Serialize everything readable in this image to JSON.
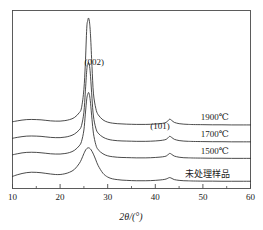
{
  "chart_data": {
    "type": "line",
    "title": "",
    "xlabel": "2θ/(°)",
    "ylabel": "",
    "xlim": [
      10,
      60
    ],
    "ylim": [
      0,
      100
    ],
    "grid": false,
    "legend_position": "inline-right",
    "xticks": [
      10,
      20,
      30,
      40,
      50,
      60
    ],
    "xtick_labels": [
      "10",
      "20",
      "30",
      "40",
      "50",
      "60"
    ],
    "xminorticks": [
      15,
      25,
      35,
      45,
      55
    ],
    "yticks": [],
    "ytick_labels": [],
    "annotations": [
      {
        "text": "(002)",
        "x": 27.2,
        "y": 97,
        "note": "graphite 002 reflection"
      },
      {
        "text": "(101)",
        "x": 41.0,
        "y": 47,
        "note": "graphite 101 reflection"
      }
    ],
    "series": [
      {
        "name": "1900℃",
        "label": "1900℃",
        "label_x": 52.5,
        "baseline": 50,
        "peak_002_position": 26.0,
        "peak_002_height": 84,
        "peak_002_fwhm": 1.6,
        "peak_101_position": 43.0,
        "peak_101_height": 4.5,
        "x": [
          10,
          11,
          12,
          13,
          14,
          15,
          16,
          17,
          18,
          19,
          20,
          21,
          22,
          23,
          24,
          24.5,
          25,
          25.3,
          25.6,
          25.8,
          26,
          26.2,
          26.4,
          26.7,
          27,
          27.5,
          28,
          29,
          30,
          31,
          32,
          33,
          34,
          35,
          36,
          37,
          38,
          39,
          40,
          41,
          42,
          42.5,
          43,
          43.5,
          44,
          45,
          46,
          47,
          48,
          50,
          52,
          54,
          56,
          58,
          60
        ],
        "y": [
          52.5,
          53.2,
          53.8,
          54.2,
          54.3,
          54.2,
          54.0,
          53.6,
          53.2,
          53.0,
          53.0,
          53.4,
          54.2,
          55.8,
          59.5,
          63.5,
          78.0,
          98.0,
          126.0,
          132.0,
          134.0,
          130.0,
          120.0,
          96.0,
          75.0,
          63.0,
          58.0,
          54.0,
          52.2,
          51.4,
          51.0,
          50.8,
          50.6,
          50.5,
          50.4,
          50.4,
          50.4,
          50.5,
          50.7,
          51.0,
          51.6,
          52.6,
          54.5,
          53.4,
          52.0,
          51.0,
          50.6,
          50.4,
          50.3,
          50.2,
          50.1,
          50.1,
          50.0,
          50.0,
          50.0
        ]
      },
      {
        "name": "1700℃",
        "label": "1700℃",
        "label_x": 52.5,
        "baseline": 37,
        "peak_002_position": 26.0,
        "peak_002_height": 62,
        "peak_002_fwhm": 1.9,
        "peak_101_position": 43.0,
        "peak_101_height": 4.0,
        "x": [
          10,
          11,
          12,
          13,
          14,
          15,
          16,
          17,
          18,
          19,
          20,
          21,
          22,
          23,
          24,
          24.5,
          25,
          25.3,
          25.6,
          25.8,
          26,
          26.2,
          26.4,
          26.7,
          27,
          27.5,
          28,
          29,
          30,
          31,
          32,
          33,
          34,
          35,
          36,
          37,
          38,
          39,
          40,
          41,
          42,
          42.5,
          43,
          43.5,
          44,
          45,
          46,
          47,
          48,
          50,
          52,
          54,
          56,
          58,
          60
        ],
        "y": [
          39.5,
          40.2,
          40.8,
          41.2,
          41.3,
          41.2,
          41.0,
          40.6,
          40.2,
          40.0,
          40.0,
          40.4,
          41.2,
          42.8,
          46.0,
          49.5,
          60.0,
          76.0,
          93.0,
          97.5,
          99.0,
          96.0,
          88.0,
          71.0,
          57.0,
          47.5,
          43.5,
          40.4,
          38.8,
          38.0,
          37.6,
          37.4,
          37.3,
          37.2,
          37.1,
          37.1,
          37.1,
          37.2,
          37.4,
          37.7,
          38.3,
          39.2,
          41.0,
          40.0,
          38.7,
          37.7,
          37.3,
          37.1,
          37.0,
          36.9,
          36.8,
          36.8,
          36.7,
          36.7,
          36.7
        ]
      },
      {
        "name": "1500℃",
        "label": "1500℃",
        "label_x": 52.5,
        "baseline": 24,
        "peak_002_position": 26.0,
        "peak_002_height": 46,
        "peak_002_fwhm": 2.3,
        "peak_101_position": 43.0,
        "peak_101_height": 3.5,
        "x": [
          10,
          11,
          12,
          13,
          14,
          15,
          16,
          17,
          18,
          19,
          20,
          21,
          22,
          23,
          24,
          24.5,
          25,
          25.3,
          25.6,
          25.8,
          26,
          26.2,
          26.4,
          26.7,
          27,
          27.5,
          28,
          29,
          30,
          31,
          32,
          33,
          34,
          35,
          36,
          37,
          38,
          39,
          40,
          41,
          42,
          42.5,
          43,
          43.5,
          44,
          45,
          46,
          47,
          48,
          50,
          52,
          54,
          56,
          58,
          60
        ],
        "y": [
          26.5,
          27.3,
          28.0,
          28.4,
          28.5,
          28.4,
          28.1,
          27.7,
          27.3,
          27.1,
          27.1,
          27.5,
          28.3,
          30.0,
          33.5,
          37.0,
          46.0,
          58.5,
          70.5,
          74.0,
          75.5,
          73.0,
          67.0,
          54.5,
          43.5,
          34.5,
          30.5,
          27.3,
          25.7,
          25.0,
          24.6,
          24.4,
          24.3,
          24.2,
          24.1,
          24.1,
          24.1,
          24.2,
          24.4,
          24.7,
          25.2,
          26.0,
          27.6,
          26.7,
          25.5,
          24.6,
          24.2,
          24.1,
          24.0,
          23.9,
          23.8,
          23.8,
          23.7,
          23.7,
          23.7
        ]
      },
      {
        "name": "未处理样品",
        "label": "未处理样品",
        "label_x": 51.0,
        "baseline": 6,
        "peak_002_position": 26.0,
        "peak_002_height": 26,
        "peak_002_fwhm": 4.2,
        "peak_101_position": 43.0,
        "peak_101_height": 2.5,
        "x": [
          10,
          11,
          12,
          13,
          14,
          15,
          16,
          17,
          18,
          19,
          20,
          21,
          22,
          23,
          24,
          24.5,
          25,
          25.5,
          26,
          26.5,
          27,
          27.5,
          28,
          29,
          30,
          31,
          32,
          33,
          34,
          35,
          36,
          37,
          38,
          39,
          40,
          41,
          42,
          42.5,
          43,
          43.5,
          44,
          45,
          46,
          47,
          48,
          50,
          52,
          54,
          56,
          58,
          60
        ],
        "y": [
          9.5,
          10.8,
          11.8,
          12.5,
          12.8,
          12.7,
          12.4,
          11.9,
          11.4,
          11.0,
          11.0,
          11.6,
          12.8,
          15.0,
          19.5,
          23.0,
          27.5,
          31.0,
          32.0,
          30.5,
          27.0,
          22.5,
          18.0,
          12.0,
          9.0,
          7.6,
          7.0,
          6.6,
          6.4,
          6.2,
          6.1,
          6.1,
          6.1,
          6.2,
          6.4,
          6.7,
          7.2,
          7.8,
          8.6,
          7.9,
          7.0,
          6.4,
          6.1,
          6.0,
          5.9,
          5.8,
          5.8,
          5.7,
          5.7,
          5.7,
          5.7
        ]
      }
    ]
  },
  "style": {
    "line_color": "#2b2b2b",
    "frame_color": "#4a4a4a",
    "background": "#ffffff"
  }
}
